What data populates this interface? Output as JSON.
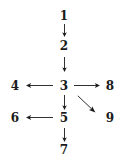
{
  "diagram": {
    "type": "directed-graph",
    "background_color": "#ffffff",
    "ink_color": "#1a1a1a",
    "nodes": [
      {
        "id": "n1",
        "label": "1",
        "x": 64,
        "y": 16
      },
      {
        "id": "n2",
        "label": "2",
        "x": 64,
        "y": 46
      },
      {
        "id": "n3",
        "label": "3",
        "x": 64,
        "y": 86
      },
      {
        "id": "n4",
        "label": "4",
        "x": 15,
        "y": 86
      },
      {
        "id": "n5",
        "label": "5",
        "x": 64,
        "y": 118
      },
      {
        "id": "n6",
        "label": "6",
        "x": 15,
        "y": 118
      },
      {
        "id": "n7",
        "label": "7",
        "x": 64,
        "y": 150
      },
      {
        "id": "n8",
        "label": "8",
        "x": 110,
        "y": 86
      },
      {
        "id": "n9",
        "label": "9",
        "x": 110,
        "y": 118
      }
    ],
    "edges": [
      {
        "id": "e1",
        "from": "n1",
        "to": "n2",
        "direction": "down",
        "glyph": "↓"
      },
      {
        "id": "e2",
        "from": "n2",
        "to": "n3",
        "direction": "down",
        "glyph": "↓"
      },
      {
        "id": "e3",
        "from": "n3",
        "to": "n4",
        "direction": "left",
        "glyph": "←"
      },
      {
        "id": "e4",
        "from": "n3",
        "to": "n8",
        "direction": "right",
        "glyph": "→"
      },
      {
        "id": "e5",
        "from": "n3",
        "to": "n9",
        "direction": "down-right",
        "glyph": "↘"
      },
      {
        "id": "e6",
        "from": "n3",
        "to": "n5",
        "direction": "down",
        "glyph": "↓"
      },
      {
        "id": "e7",
        "from": "n5",
        "to": "n6",
        "direction": "left",
        "glyph": "←"
      },
      {
        "id": "e8",
        "from": "n5",
        "to": "n7",
        "direction": "down",
        "glyph": "↓"
      }
    ]
  }
}
